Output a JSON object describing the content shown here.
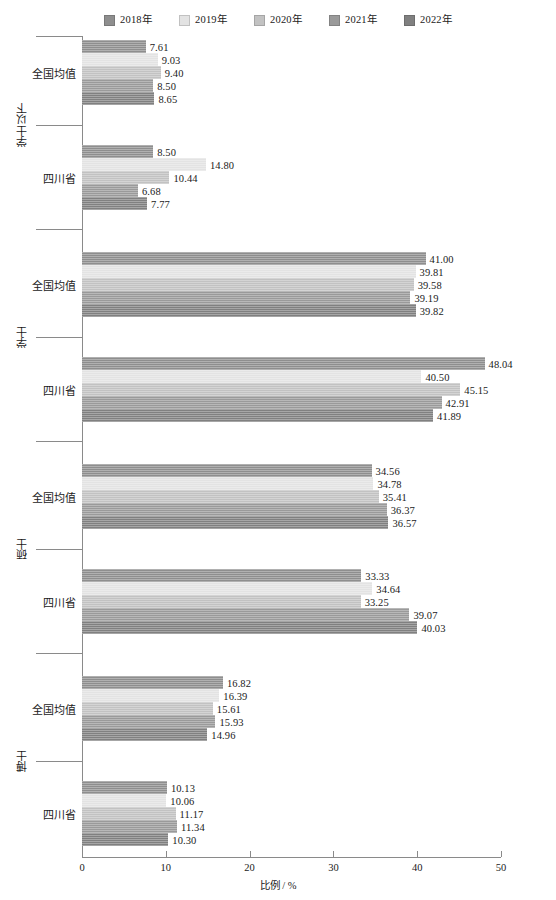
{
  "chart_data": {
    "type": "bar",
    "orientation": "horizontal",
    "title": "",
    "xlabel": "比例 / %",
    "ylabel": "",
    "xlim": [
      0,
      50
    ],
    "xticks": [
      0,
      10,
      20,
      30,
      40,
      50
    ],
    "grid": false,
    "legend_position": "top-center",
    "series": [
      {
        "name": "2018年",
        "color": "#8e8e8e"
      },
      {
        "name": "2019年",
        "color": "#e3e3e3"
      },
      {
        "name": "2020年",
        "color": "#c2c2c2"
      },
      {
        "name": "2021年",
        "color": "#9a9a9a"
      },
      {
        "name": "2022年",
        "color": "#808080"
      }
    ],
    "groups": [
      {
        "label": "学士以下",
        "subgroups": [
          {
            "label": "全国均值",
            "values": [
              7.61,
              9.03,
              9.4,
              8.5,
              8.65
            ]
          },
          {
            "label": "四川省",
            "values": [
              8.5,
              14.8,
              10.44,
              6.68,
              7.77
            ]
          }
        ]
      },
      {
        "label": "学士",
        "subgroups": [
          {
            "label": "全国均值",
            "values": [
              41.0,
              39.81,
              39.58,
              39.19,
              39.82
            ]
          },
          {
            "label": "四川省",
            "values": [
              48.04,
              40.5,
              45.15,
              42.91,
              41.89
            ]
          }
        ]
      },
      {
        "label": "硕士",
        "subgroups": [
          {
            "label": "全国均值",
            "values": [
              34.56,
              34.78,
              35.41,
              36.37,
              36.57
            ]
          },
          {
            "label": "四川省",
            "values": [
              33.33,
              34.64,
              33.25,
              39.07,
              40.03
            ]
          }
        ]
      },
      {
        "label": "博士",
        "subgroups": [
          {
            "label": "全国均值",
            "values": [
              16.82,
              16.39,
              15.61,
              15.93,
              14.96
            ]
          },
          {
            "label": "四川省",
            "values": [
              10.13,
              10.06,
              11.17,
              11.34,
              10.3
            ]
          }
        ]
      }
    ]
  },
  "legend": {
    "items": [
      {
        "label": "2018年",
        "color": "#8e8e8e"
      },
      {
        "label": "2019年",
        "color": "#e3e3e3"
      },
      {
        "label": "2020年",
        "color": "#c2c2c2"
      },
      {
        "label": "2021年",
        "color": "#9a9a9a"
      },
      {
        "label": "2022年",
        "color": "#808080"
      }
    ]
  },
  "axis": {
    "x_label": "比例 / %",
    "x_ticks": [
      "0",
      "10",
      "20",
      "30",
      "40",
      "50"
    ]
  },
  "caption": ""
}
